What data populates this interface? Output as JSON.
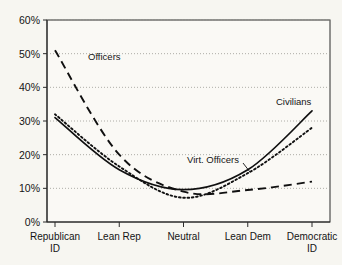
{
  "chart_data": {
    "type": "line",
    "title": "",
    "xlabel": "",
    "ylabel": "",
    "ylim": [
      0,
      60
    ],
    "yticks": [
      0,
      10,
      20,
      30,
      40,
      50,
      60
    ],
    "ytick_labels": [
      "0%",
      "10%",
      "20%",
      "30%",
      "40%",
      "50%",
      "60%"
    ],
    "grid": true,
    "legend_position": "inline-annotations",
    "categories": [
      "Republican ID",
      "Lean Rep",
      "Neutral",
      "Lean Dem",
      "Democratic ID"
    ],
    "category_lines": [
      [
        "Republican",
        "ID"
      ],
      [
        "Lean Rep",
        ""
      ],
      [
        "Neutral",
        ""
      ],
      [
        "Lean Dem",
        ""
      ],
      [
        "Democratic",
        "ID"
      ]
    ],
    "series": [
      {
        "name": "Officers",
        "style": "dashed",
        "values": [
          51,
          20,
          9,
          9.5,
          12
        ],
        "label_x_pct": 14.5,
        "label_y_pct": 51.5
      },
      {
        "name": "Civilians",
        "style": "solid",
        "values": [
          31,
          15.5,
          9.6,
          15.5,
          33
        ],
        "label_x_pct": 81,
        "label_y_pct": 35.5
      },
      {
        "name": "Virt. Officers",
        "style": "dotted",
        "values": [
          32,
          16.5,
          7.2,
          14.5,
          28
        ],
        "label_x_pct": 50,
        "label_y_pct": 18.5
      }
    ]
  },
  "annotations": {
    "officers_label": "Officers",
    "civilians_label": "Civilians",
    "virt_officers_label": "Virt. Officers"
  }
}
